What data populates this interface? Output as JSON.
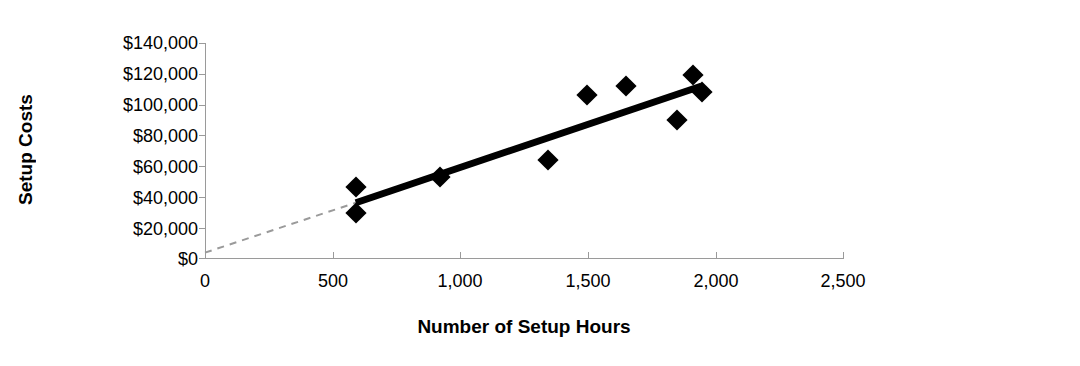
{
  "chart_data": {
    "type": "scatter",
    "title": "",
    "subtitle": "",
    "xlabel": "Number of Setup Hours",
    "ylabel": "Setup Costs",
    "xlim": [
      0,
      2500
    ],
    "ylim": [
      0,
      140000
    ],
    "grid": false,
    "legend": "none",
    "x_ticks": [
      0,
      500,
      1000,
      1500,
      2000,
      2500
    ],
    "x_tick_labels": [
      "0",
      "500",
      "1,000",
      "1,500",
      "2,000",
      "2,500"
    ],
    "y_ticks": [
      0,
      20000,
      40000,
      60000,
      80000,
      100000,
      120000,
      140000
    ],
    "y_tick_labels": [
      "$0",
      "$20,000",
      "$40,000",
      "$60,000",
      "$80,000",
      "$100,000",
      "$120,000",
      "$140,000"
    ],
    "points": [
      {
        "x": 590,
        "y": 29000
      },
      {
        "x": 592,
        "y": 46000
      },
      {
        "x": 921,
        "y": 53000
      },
      {
        "x": 1343,
        "y": 64000
      },
      {
        "x": 1497,
        "y": 106000
      },
      {
        "x": 1648,
        "y": 112000
      },
      {
        "x": 1849,
        "y": 90000
      },
      {
        "x": 1911,
        "y": 119000
      },
      {
        "x": 1949,
        "y": 108000
      }
    ],
    "series": [
      {
        "name": "Setup Costs vs Setup Hours",
        "marker": "diamond",
        "marker_color": "#000000",
        "marker_size": 15
      }
    ],
    "trend_line": {
      "name": "regression-line",
      "style": "solid",
      "color": "#000000",
      "width": 7,
      "x_start": 591,
      "y_start": 36000,
      "x_end": 1946,
      "y_end": 112000
    },
    "extrapolation_line": {
      "name": "extrapolated-intercept-line",
      "style": "dashed",
      "color": "#9a9a9a",
      "width": 2,
      "x_start": 0,
      "y_start": 3500,
      "x_end": 591,
      "y_end": 36000
    },
    "colors": {
      "marker": "#000000",
      "trend": "#000000",
      "axis": "#9a9a9a",
      "text": "#000000",
      "background": "#ffffff"
    }
  }
}
